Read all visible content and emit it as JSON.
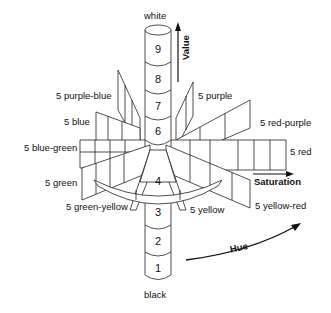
{
  "diagram": {
    "axes": {
      "value": "Value",
      "saturation": "Saturation",
      "hue": "Hue"
    },
    "column": {
      "top_label": "white",
      "bottom_label": "black",
      "levels": [
        "1",
        "2",
        "3",
        "4",
        "5",
        "6",
        "7",
        "8",
        "9"
      ]
    },
    "hues": {
      "purple_blue": "5 purple-blue",
      "purple": "5 purple",
      "blue": "5 blue",
      "red_purple": "5 red-purple",
      "blue_green": "5 blue-green",
      "red": "5 red",
      "green": "5 green",
      "green_yellow": "5 green-yellow",
      "yellow": "5 yellow",
      "yellow_red": "5 yellow-red"
    },
    "colors": {
      "line": "#222222",
      "background": "#ffffff"
    }
  }
}
